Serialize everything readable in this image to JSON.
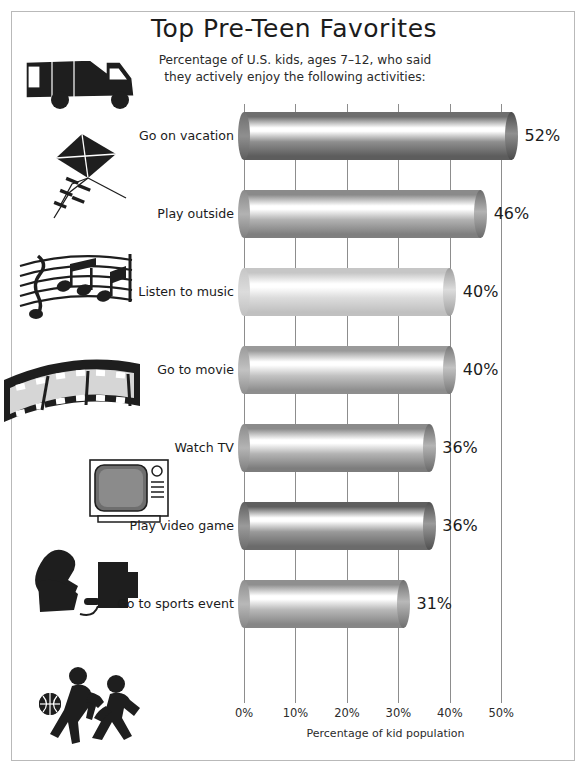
{
  "chart_data": {
    "type": "bar",
    "orientation": "horizontal",
    "title": "Top Pre-Teen Favorites",
    "subtitle_line1": "Percentage of U.S. kids, ages 7–12, who said",
    "subtitle_line2": "they actively enjoy the following activities:",
    "xlabel": "Percentage of kid population",
    "ylabel": "",
    "xlim": [
      0,
      55
    ],
    "grid": true,
    "legend": "none",
    "tick_labels": [
      "0%",
      "10%",
      "20%",
      "30%",
      "40%",
      "50%"
    ],
    "tick_values": [
      0,
      10,
      20,
      30,
      40,
      50
    ],
    "categories": [
      "Go on vacation",
      "Play outside",
      "Listen to music",
      "Go to movie",
      "Watch TV",
      "Play video game",
      "Go to sports event"
    ],
    "values": [
      52,
      46,
      40,
      40,
      36,
      36,
      31
    ],
    "value_labels": [
      "52%",
      "46%",
      "40%",
      "40%",
      "36%",
      "36%",
      "31%"
    ],
    "bar_shades": [
      {
        "top": "#6e6e6e",
        "highlight": "#ffffff",
        "mid": "#8f8f8f",
        "bottom": "#5d5d5d",
        "cap": "#4a4a4a"
      },
      {
        "top": "#8a8a8a",
        "highlight": "#ffffff",
        "mid": "#b2b2b2",
        "bottom": "#7f7f7f",
        "cap": "#6a6a6a"
      },
      {
        "top": "#c6c6c6",
        "highlight": "#ffffff",
        "mid": "#dcdcdc",
        "bottom": "#c0c0c0",
        "cap": "#9e9e9e"
      },
      {
        "top": "#9a9a9a",
        "highlight": "#ffffff",
        "mid": "#c2c2c2",
        "bottom": "#8e8e8e",
        "cap": "#777777"
      },
      {
        "top": "#8b8b8b",
        "highlight": "#ffffff",
        "mid": "#b4b4b4",
        "bottom": "#7d7d7d",
        "cap": "#686868"
      },
      {
        "top": "#5f5f5f",
        "highlight": "#ffffff",
        "mid": "#9a9a9a",
        "bottom": "#6b6b6b",
        "cap": "#4f4f4f"
      },
      {
        "top": "#8f8f8f",
        "highlight": "#ffffff",
        "mid": "#b8b8b8",
        "bottom": "#868686",
        "cap": "#6f6f6f"
      }
    ]
  },
  "icons": [
    {
      "name": "rv-camper-icon",
      "category": "Go on vacation"
    },
    {
      "name": "kite-icon",
      "category": "Play outside"
    },
    {
      "name": "music-notes-icon",
      "category": "Listen to music"
    },
    {
      "name": "film-strip-icon",
      "category": "Go to movie"
    },
    {
      "name": "television-icon",
      "category": "Watch TV"
    },
    {
      "name": "video-gamer-icon",
      "category": "Play video game"
    },
    {
      "name": "basketball-players-icon",
      "category": "Go to sports event"
    }
  ],
  "colors": {
    "page_background": "#ffffff",
    "border": "#b9b9b9",
    "gridline": "#8d8d8d",
    "text": "#1a1a1a",
    "icon_ink": "#1e1e1e"
  }
}
